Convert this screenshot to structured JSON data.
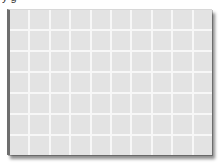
{
  "caption": {
    "text": "y                                                    g"
  },
  "grid": {
    "columns": 10,
    "rows": 7,
    "cell_color": "#e3e3e3",
    "line_color": "#f7f7f7",
    "frame_edge_color": "#6e6e6e"
  }
}
